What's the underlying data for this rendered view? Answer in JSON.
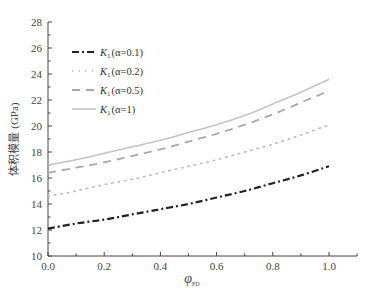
{
  "chart_data": {
    "type": "line",
    "title": "",
    "xlabel": "φ_FD",
    "xlabel_main": "φ",
    "xlabel_sub": "FD",
    "ylabel": "体积模量 (GPa)",
    "xlim": [
      0.0,
      1.1
    ],
    "ylim": [
      10,
      28
    ],
    "x_ticks": [
      "0.0",
      "0.2",
      "0.4",
      "0.6",
      "0.8",
      "1.0"
    ],
    "y_ticks": [
      "10",
      "12",
      "14",
      "16",
      "18",
      "20",
      "22",
      "24",
      "26",
      "28"
    ],
    "grid": false,
    "legend_position": "upper left",
    "x": [
      0.0,
      0.1,
      0.2,
      0.3,
      0.4,
      0.5,
      0.6,
      0.7,
      0.8,
      0.9,
      1.0
    ],
    "series": [
      {
        "name": "K1(α=0.1)",
        "label_main": "K",
        "label_sub": "1",
        "label_param": "(α=0.1)",
        "style": "dashdot",
        "color": "#222222",
        "width": 2.2,
        "values": [
          12.1,
          12.5,
          12.8,
          13.2,
          13.6,
          14.0,
          14.5,
          15.0,
          15.6,
          16.2,
          16.9
        ]
      },
      {
        "name": "K1(α=0.2)",
        "label_main": "K",
        "label_sub": "1",
        "label_param": "(α=0.2)",
        "style": "dotted",
        "color": "#bbbbbb",
        "width": 1.6,
        "values": [
          14.6,
          15.0,
          15.5,
          15.9,
          16.4,
          16.9,
          17.4,
          18.0,
          18.6,
          19.3,
          20.1
        ]
      },
      {
        "name": "K1(α=0.5)",
        "label_main": "K",
        "label_sub": "1",
        "label_param": "(α=0.5)",
        "style": "dashed",
        "color": "#a8a8a8",
        "width": 1.8,
        "values": [
          16.4,
          16.8,
          17.2,
          17.7,
          18.2,
          18.8,
          19.4,
          20.1,
          20.9,
          21.8,
          22.7
        ]
      },
      {
        "name": "K1(α=1)",
        "label_main": "K",
        "label_sub": "1",
        "label_param": "(α=1)",
        "style": "solid",
        "color": "#c4c4c4",
        "width": 1.6,
        "values": [
          17.0,
          17.4,
          17.9,
          18.4,
          18.9,
          19.5,
          20.1,
          20.8,
          21.7,
          22.6,
          23.6
        ]
      }
    ]
  }
}
